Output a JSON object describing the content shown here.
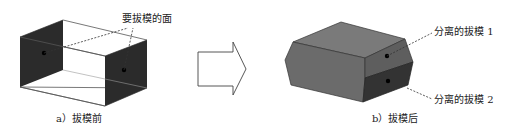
{
  "figure": {
    "left": {
      "annotation": "要拔模的面",
      "caption": "a）拔模前"
    },
    "arrow": {
      "direction": "right"
    },
    "right": {
      "annotation_1": "分离的拔模 1",
      "annotation_2": "分离的拔模 2",
      "caption": "b）拔模后"
    }
  },
  "colors": {
    "dark_face": "#2b2b2b",
    "mid_face": "#6e6e6e",
    "top_face": "#7a7a7a",
    "right_upper": "#5e5e5e",
    "right_lower": "#333333",
    "outline": "#333333"
  }
}
